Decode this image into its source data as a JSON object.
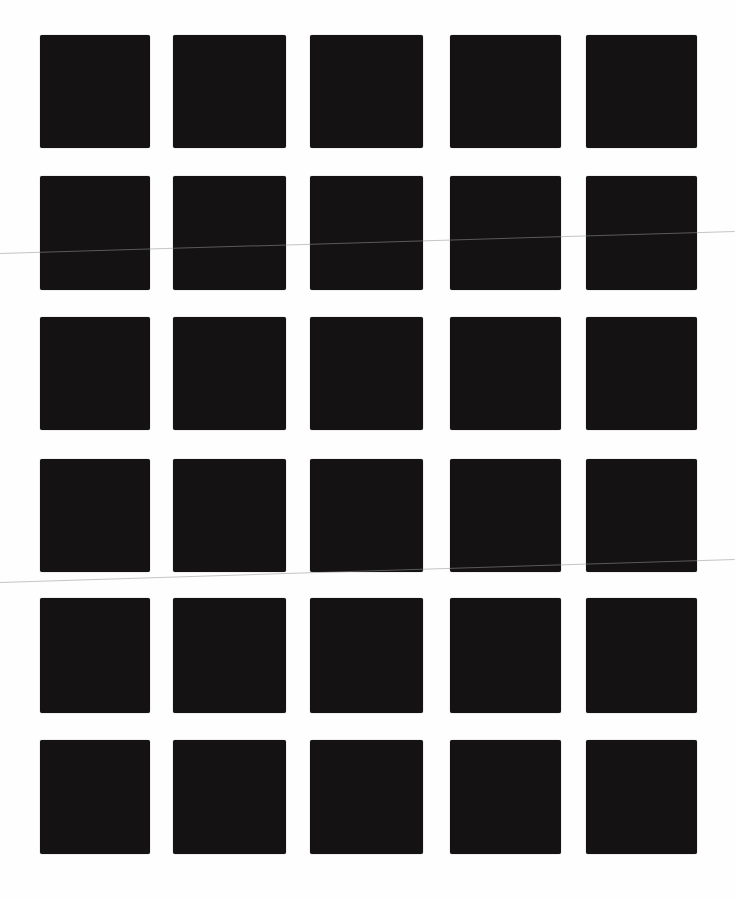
{
  "page": {
    "background": "#fefefe",
    "square_color": "#141213",
    "grid": {
      "columns": 5,
      "rows": 6,
      "col_x": [
        {
          "left": 40,
          "width": 110
        },
        {
          "left": 173,
          "width": 113
        },
        {
          "left": 310,
          "width": 113
        },
        {
          "left": 450,
          "width": 111
        },
        {
          "left": 586,
          "width": 111
        }
      ],
      "row_y": [
        {
          "top": 35,
          "height": 113
        },
        {
          "top": 176,
          "height": 114
        },
        {
          "top": 317,
          "height": 113
        },
        {
          "top": 459,
          "height": 113
        },
        {
          "top": 598,
          "height": 115
        },
        {
          "top": 740,
          "height": 114
        }
      ]
    },
    "scan_lines": [
      {
        "x1": 0,
        "y1": 253,
        "x2": 735,
        "y2": 231
      },
      {
        "x1": 0,
        "y1": 582,
        "x2": 735,
        "y2": 559
      }
    ]
  }
}
